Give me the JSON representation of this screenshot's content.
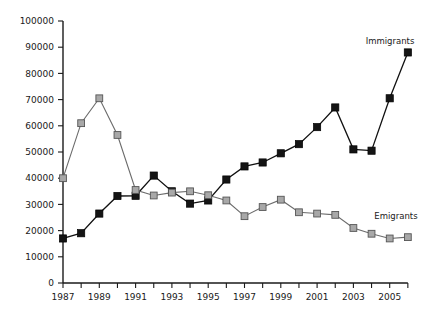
{
  "chart_data": {
    "type": "line",
    "title": "",
    "subtitle": "",
    "xlabel": "",
    "ylabel": "",
    "xlim": [
      1987,
      2006
    ],
    "ylim": [
      0,
      100000
    ],
    "grid": false,
    "legend_position": "inline-right",
    "x": [
      1987,
      1988,
      1989,
      1990,
      1991,
      1992,
      1993,
      1994,
      1995,
      1996,
      1997,
      1998,
      1999,
      2000,
      2001,
      2002,
      2003,
      2004,
      2005,
      2006
    ],
    "x_tick_labels": [
      "1987",
      "",
      "1989",
      "",
      "1991",
      "",
      "1993",
      "",
      "1995",
      "",
      "1997",
      "",
      "1999",
      "",
      "2001",
      "",
      "2003",
      "",
      "2005",
      ""
    ],
    "y_tick_values": [
      0,
      10000,
      20000,
      30000,
      40000,
      50000,
      60000,
      70000,
      80000,
      90000,
      100000
    ],
    "y_tick_labels": [
      "0",
      "10000",
      "20000",
      "30000",
      "40000",
      "50000",
      "60000",
      "70000",
      "80000",
      "90000",
      "100000"
    ],
    "series": [
      {
        "name": "Immigrants",
        "label": "Immigrants",
        "color": "#141414",
        "marker": "filled-square",
        "values": [
          17000,
          19000,
          26500,
          33200,
          33300,
          41000,
          35000,
          30300,
          31500,
          39500,
          44500,
          46000,
          49500,
          53000,
          59500,
          67000,
          51000,
          50500,
          70500,
          88000
        ]
      },
      {
        "name": "Emigrants",
        "label": "Emigrants",
        "color": "#a8a8a8",
        "marker": "grey-square",
        "values": [
          40000,
          61000,
          70500,
          56500,
          35500,
          33400,
          34500,
          35000,
          33500,
          31500,
          25500,
          29000,
          31800,
          27000,
          26500,
          26000,
          21000,
          18800,
          17000,
          17500
        ]
      }
    ]
  }
}
